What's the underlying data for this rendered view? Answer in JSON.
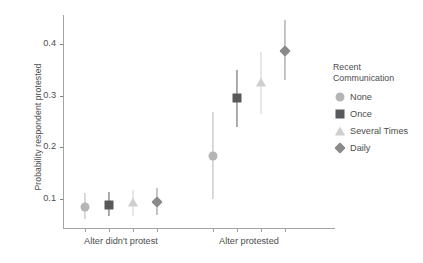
{
  "chart_data": {
    "type": "scatter",
    "title": "",
    "subtitle": "",
    "xlabel": "",
    "ylabel": "Probability respondent protested",
    "ylim": [
      0.045,
      0.455
    ],
    "yticks": [
      0.1,
      0.2,
      0.3,
      0.4
    ],
    "ytick_labels": [
      "0.1",
      "0.2",
      "0.3",
      "0.4"
    ],
    "grid": false,
    "categories": [
      "Alter didn't protest",
      "Alter protested"
    ],
    "legend": {
      "title": "Recent\nCommunication",
      "position": "right",
      "entries": [
        "None",
        "Once",
        "Several Times",
        "Daily"
      ]
    },
    "series": [
      {
        "name": "None",
        "marker": "circle",
        "color": "#b5b5b5",
        "values": [
          0.086,
          0.184
        ],
        "ci_low": [
          0.063,
          0.101
        ],
        "ci_high": [
          0.112,
          0.268
        ]
      },
      {
        "name": "Once",
        "marker": "square",
        "color": "#595959",
        "values": [
          0.09,
          0.295
        ],
        "ci_low": [
          0.068,
          0.24
        ],
        "ci_high": [
          0.115,
          0.35
        ]
      },
      {
        "name": "Several Times",
        "marker": "triangle",
        "color": "#cfcfcf",
        "values": [
          0.092,
          0.322
        ],
        "ci_low": [
          0.069,
          0.265
        ],
        "ci_high": [
          0.118,
          0.383
        ]
      },
      {
        "name": "Daily",
        "marker": "diamond",
        "color": "#8a8a8a",
        "values": [
          0.096,
          0.385
        ],
        "ci_low": [
          0.07,
          0.33
        ],
        "ci_high": [
          0.122,
          0.445
        ]
      }
    ]
  },
  "axes": {
    "y_title": "Probability respondent protested",
    "x_labels": [
      "Alter didn't protest",
      "Alter protested"
    ]
  },
  "legend": {
    "title": "Recent\nCommunication",
    "items": [
      {
        "label": "None"
      },
      {
        "label": "Once"
      },
      {
        "label": "Several Times"
      },
      {
        "label": "Daily"
      }
    ]
  },
  "colors": {
    "none": "#b5b5b5",
    "once": "#595959",
    "several_times": "#cfcfcf",
    "daily": "#8a8a8a",
    "axis": "#a3a3a3",
    "text": "#4d4d4d"
  }
}
